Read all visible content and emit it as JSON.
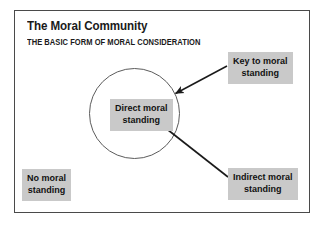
{
  "figure": {
    "title": "The Moral Community",
    "subtitle": "THE BASIC FORM OF MORAL CONSIDERATION",
    "frame_color": "#4a4a4a",
    "box_fill_color": "#c9c9c9",
    "text_color": "#111111",
    "background_color": "#ffffff"
  },
  "circle": {
    "name": "moral-community-circle",
    "stroke_color": "#5c5c5c"
  },
  "labels": {
    "direct": {
      "line1": "Direct moral",
      "line2": "standing"
    },
    "key": {
      "line1": "Key to moral",
      "line2": "standing"
    },
    "indirect": {
      "line1": "Indirect moral",
      "line2": "standing"
    },
    "none": {
      "line1": "No moral",
      "line2": "standing"
    }
  },
  "connectors": [
    {
      "name": "key-to-circle-arrow",
      "from": "key",
      "to": "circle-edge",
      "has_arrowhead": true
    },
    {
      "name": "direct-to-indirect-line",
      "from": "direct-label",
      "to": "indirect",
      "has_arrowhead": false
    }
  ]
}
